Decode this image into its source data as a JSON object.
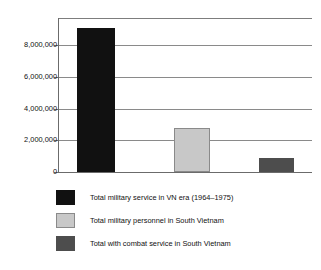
{
  "chart_data": {
    "type": "bar",
    "title": "",
    "subtitle": "",
    "xlabel": "",
    "ylabel": "",
    "categories": [
      "Total military service in VN era (1964–1975)",
      "Total military personnel in South Vietnam",
      "Total with combat service in South Vietnam"
    ],
    "values": [
      8400000,
      2600000,
      800000
    ],
    "ylim": [
      0,
      9000000
    ],
    "yticks": [
      0,
      2000000,
      4000000,
      6000000,
      8000000
    ],
    "ytick_labels": [
      "0",
      "2,000,000",
      "4,000,000",
      "6,000,000",
      "8,000,000"
    ],
    "xtick_labels": [
      "",
      "",
      ""
    ],
    "grid": true,
    "grid_axis": "y",
    "legend_position": "below",
    "colors": [
      "#111111",
      "#c8c8c8",
      "#4d4d4d"
    ],
    "series": [
      {
        "name": "Total military service in VN era (1964–1975)",
        "value": 8400000,
        "color": "#111111"
      },
      {
        "name": "Total military personnel in South Vietnam",
        "value": 2600000,
        "color": "#c8c8c8"
      },
      {
        "name": "Total with combat service in South Vietnam",
        "value": 800000,
        "color": "#4d4d4d"
      }
    ]
  },
  "axis": {
    "ytick_labels": [
      "8,000,000",
      "6,000,000",
      "4,000,000",
      "2,000,000",
      "0"
    ]
  },
  "legend": {
    "items": [
      {
        "label": "Total military service in VN era (1964–1975)",
        "color": "#111111",
        "border": "#111111"
      },
      {
        "label": "Total military personnel in South Vietnam",
        "color": "#c8c8c8",
        "border": "#8a8a8a"
      },
      {
        "label": "Total with combat service in South Vietnam",
        "color": "#4d4d4d",
        "border": "#4d4d4d"
      }
    ]
  },
  "style": {
    "axis_color": "#6b6b6b",
    "grid_color": "#8a8a8a",
    "background": "#ffffff",
    "text_color": "#111111"
  }
}
